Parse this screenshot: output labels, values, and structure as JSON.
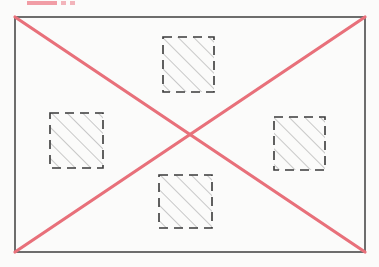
{
  "figure": {
    "title": "",
    "background_color": "#fbfbfa",
    "frame": {
      "name": "outer-rectangle",
      "x": 15,
      "y": 17,
      "width": 350,
      "height": 235,
      "stroke_color": "#4a4a4a",
      "stroke_width": 1.6,
      "fill": "none"
    },
    "diagonals": {
      "name": "red-cross",
      "stroke_color": "#e8707a",
      "stroke_width": 3.2,
      "lines": [
        {
          "label": "diagonal-top-left-to-bottom-right",
          "x1": 15,
          "y1": 17,
          "x2": 365,
          "y2": 252
        },
        {
          "label": "diagonal-bottom-left-to-top-right",
          "x1": 15,
          "y1": 252,
          "x2": 365,
          "y2": 17
        }
      ],
      "intersection": {
        "x": 190,
        "y": 134.5
      }
    },
    "hatched_squares": [
      {
        "label": "top",
        "x": 163,
        "y": 37,
        "width": 51,
        "height": 55,
        "stroke_color": "#3a3a3a",
        "stroke_width": 1.6,
        "dash_pattern": "9 6",
        "hatch_angle_deg": 45,
        "hatch_spacing": 11,
        "hatch_color": "#8a8a8a",
        "hatch_width": 0.9
      },
      {
        "label": "left",
        "x": 50,
        "y": 113,
        "width": 53,
        "height": 55,
        "stroke_color": "#3a3a3a",
        "stroke_width": 1.6,
        "dash_pattern": "9 6",
        "hatch_angle_deg": 45,
        "hatch_spacing": 11,
        "hatch_color": "#8a8a8a",
        "hatch_width": 0.9
      },
      {
        "label": "right",
        "x": 274,
        "y": 117,
        "width": 51,
        "height": 53,
        "stroke_color": "#3a3a3a",
        "stroke_width": 1.6,
        "dash_pattern": "9 6",
        "hatch_angle_deg": 45,
        "hatch_spacing": 11,
        "hatch_color": "#8a8a8a",
        "hatch_width": 0.9
      },
      {
        "label": "bottom",
        "x": 159,
        "y": 175,
        "width": 53,
        "height": 53,
        "stroke_color": "#3a3a3a",
        "stroke_width": 1.6,
        "dash_pattern": "9 6",
        "hatch_angle_deg": 45,
        "hatch_spacing": 11,
        "hatch_color": "#8a8a8a",
        "hatch_width": 0.9
      }
    ],
    "top_artifact": {
      "label": "cropped-pink-bar",
      "color": "#ef8c95"
    }
  }
}
